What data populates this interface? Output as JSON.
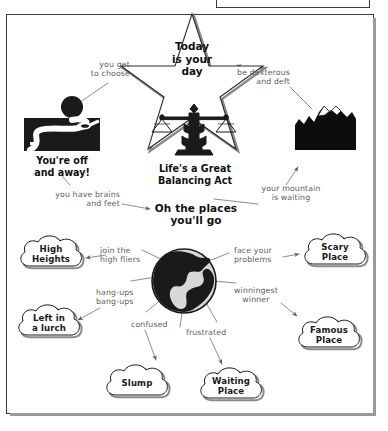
{
  "page": {
    "title": "Oh the places you'll go",
    "clipped_top_note": "Start climbing the mountain."
  },
  "nodes": {
    "star": {
      "name": "star-node",
      "text": "Today\nis your\nday",
      "lines": [
        "Today",
        "is your",
        "day"
      ]
    },
    "road": {
      "name": "road-image-node",
      "caption_lines": [
        "You're off",
        "and away!"
      ]
    },
    "scale": {
      "name": "balance-scale-node",
      "caption_lines": [
        "Life's a Great",
        "Balancing Act"
      ]
    },
    "mountain": {
      "name": "mountain-image-node",
      "caption_lines": []
    },
    "center": {
      "name": "center-title",
      "lines": [
        "Oh the places",
        "you'll go"
      ]
    },
    "globe": {
      "name": "globe-node"
    }
  },
  "clouds": [
    {
      "id": "high-heights",
      "lines": [
        "High",
        "Heights"
      ]
    },
    {
      "id": "left-in-a-lurch",
      "lines": [
        "Left in",
        "a lurch"
      ]
    },
    {
      "id": "slump",
      "lines": [
        "Slump"
      ]
    },
    {
      "id": "waiting-place",
      "lines": [
        "Waiting",
        "Place"
      ]
    },
    {
      "id": "famous-place",
      "lines": [
        "Famous",
        "Place"
      ]
    },
    {
      "id": "scary-place",
      "lines": [
        "Scary",
        "Place"
      ]
    }
  ],
  "connector_labels": [
    {
      "id": "you-get-to-choose",
      "lines": [
        "you get",
        "to choose"
      ]
    },
    {
      "id": "be-dexterous-and-deft",
      "lines": [
        "be dexterous",
        "and deft"
      ]
    },
    {
      "id": "you-have-brains-and-feet",
      "lines": [
        "you have brains",
        "and feet"
      ]
    },
    {
      "id": "your-mountain-is-waiting",
      "lines": [
        "your mountain",
        "is waiting"
      ]
    },
    {
      "id": "join-the-high-fliers",
      "lines": [
        "join the",
        "high fliers"
      ]
    },
    {
      "id": "face-your-problems",
      "lines": [
        "face your",
        "problems"
      ]
    },
    {
      "id": "hang-ups-bang-ups",
      "lines": [
        "hang-ups",
        "bang-ups"
      ]
    },
    {
      "id": "winningest-winner",
      "lines": [
        "winningest",
        "winner"
      ]
    },
    {
      "id": "confused",
      "lines": [
        "confused"
      ]
    },
    {
      "id": "frustrated",
      "lines": [
        "frustrated"
      ]
    }
  ],
  "colors": {
    "ink": "#111111",
    "pencil": "#5d5d5d",
    "frame": "#3a3a3a",
    "shadow": "#9a9a9a",
    "globe_land": "#1a1a1a",
    "globe_sea": "#d8d8d8"
  }
}
